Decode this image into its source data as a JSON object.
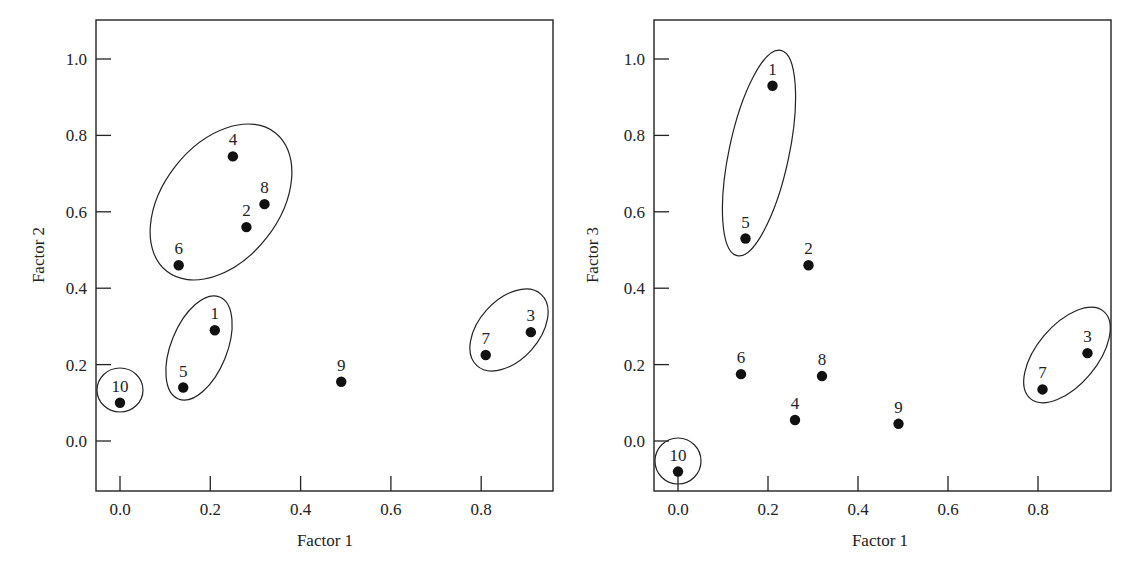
{
  "chart_data": [
    {
      "type": "scatter",
      "title": "",
      "xlabel": "Factor 1",
      "ylabel": "Factor 2",
      "xlim": [
        -0.05,
        0.96
      ],
      "ylim": [
        -0.13,
        1.1
      ],
      "xticks": [
        "0.0",
        "0.2",
        "0.4",
        "0.6",
        "0.8"
      ],
      "yticks": [
        "0.0",
        "0.2",
        "0.4",
        "0.6",
        "0.8",
        "1.0"
      ],
      "grid": false,
      "legend": null,
      "points": [
        {
          "label": "1",
          "x": 0.21,
          "y": 0.29
        },
        {
          "label": "2",
          "x": 0.28,
          "y": 0.56
        },
        {
          "label": "3",
          "x": 0.91,
          "y": 0.285
        },
        {
          "label": "4",
          "x": 0.25,
          "y": 0.745
        },
        {
          "label": "5",
          "x": 0.14,
          "y": 0.14
        },
        {
          "label": "6",
          "x": 0.13,
          "y": 0.46
        },
        {
          "label": "7",
          "x": 0.81,
          "y": 0.225
        },
        {
          "label": "8",
          "x": 0.32,
          "y": 0.62
        },
        {
          "label": "9",
          "x": 0.49,
          "y": 0.155
        },
        {
          "label": "10",
          "x": 0.0,
          "y": 0.1
        }
      ],
      "clusters": [
        {
          "members": [
            "2",
            "4",
            "6",
            "8"
          ]
        },
        {
          "members": [
            "1",
            "5"
          ]
        },
        {
          "members": [
            "10"
          ]
        },
        {
          "members": [
            "3",
            "7"
          ]
        }
      ]
    },
    {
      "type": "scatter",
      "title": "",
      "xlabel": "Factor 1",
      "ylabel": "Factor 3",
      "xlim": [
        -0.05,
        0.96
      ],
      "ylim": [
        -0.13,
        1.1
      ],
      "xticks": [
        "0.0",
        "0.2",
        "0.4",
        "0.6",
        "0.8"
      ],
      "yticks": [
        "0.0",
        "0.2",
        "0.4",
        "0.6",
        "0.8",
        "1.0"
      ],
      "grid": false,
      "legend": null,
      "points": [
        {
          "label": "1",
          "x": 0.21,
          "y": 0.93
        },
        {
          "label": "2",
          "x": 0.29,
          "y": 0.46
        },
        {
          "label": "3",
          "x": 0.91,
          "y": 0.23
        },
        {
          "label": "4",
          "x": 0.26,
          "y": 0.055
        },
        {
          "label": "5",
          "x": 0.15,
          "y": 0.53
        },
        {
          "label": "6",
          "x": 0.14,
          "y": 0.175
        },
        {
          "label": "7",
          "x": 0.81,
          "y": 0.135
        },
        {
          "label": "8",
          "x": 0.32,
          "y": 0.17
        },
        {
          "label": "9",
          "x": 0.49,
          "y": 0.045
        },
        {
          "label": "10",
          "x": 0.0,
          "y": -0.08
        }
      ],
      "clusters": [
        {
          "members": [
            "1",
            "5"
          ]
        },
        {
          "members": [
            "10"
          ]
        },
        {
          "members": [
            "3",
            "7"
          ]
        }
      ]
    }
  ]
}
